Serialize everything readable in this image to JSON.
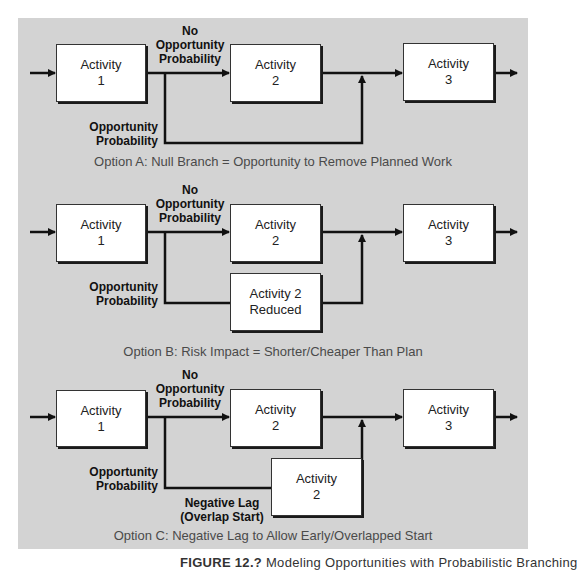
{
  "options": [
    {
      "id": "A",
      "boxes": [
        {
          "line1": "Activity",
          "line2": "1"
        },
        {
          "line1": "Activity",
          "line2": "2"
        },
        {
          "line1": "Activity",
          "line2": "3"
        }
      ],
      "no_opportunity_label": [
        "No",
        "Opportunity",
        "Probability"
      ],
      "opportunity_label": [
        "Opportunity",
        "Probability"
      ],
      "caption": "Option A: Null Branch = Opportunity to Remove Planned Work"
    },
    {
      "id": "B",
      "boxes": [
        {
          "line1": "Activity",
          "line2": "1"
        },
        {
          "line1": "Activity",
          "line2": "2"
        },
        {
          "line1": "Activity",
          "line2": "3"
        }
      ],
      "branch_box": {
        "line1": "Activity 2",
        "line2": "Reduced"
      },
      "no_opportunity_label": [
        "No",
        "Opportunity",
        "Probability"
      ],
      "opportunity_label": [
        "Opportunity",
        "Probability"
      ],
      "caption": "Option B: Risk Impact = Shorter/Cheaper Than Plan"
    },
    {
      "id": "C",
      "boxes": [
        {
          "line1": "Activity",
          "line2": "1"
        },
        {
          "line1": "Activity",
          "line2": "2"
        },
        {
          "line1": "Activity",
          "line2": "3"
        }
      ],
      "branch_box": {
        "line1": "Activity",
        "line2": "2"
      },
      "no_opportunity_label": [
        "No",
        "Opportunity",
        "Probability"
      ],
      "opportunity_label": [
        "Opportunity",
        "Probability"
      ],
      "lag_label": [
        "Negative Lag",
        "(Overlap Start)"
      ],
      "caption": "Option C: Negative Lag to Allow Early/Overlapped Start"
    }
  ],
  "figure_caption": {
    "label": "FIGURE 12.?",
    "text": "Modeling Opportunities with Probabilistic Branching"
  },
  "colors": {
    "panel_background": "#d3d3d3",
    "box_fill": "#ffffff",
    "line": "#111111",
    "caption_text": "#4a4a4a"
  }
}
